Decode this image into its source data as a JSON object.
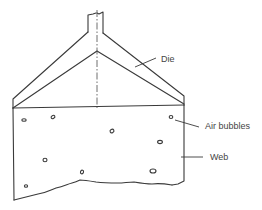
{
  "diagram": {
    "type": "technical-schematic",
    "labels": {
      "die": "Die",
      "air_bubbles": "Air bubbles",
      "web": "Web"
    },
    "colors": {
      "line": "#3a3a3a",
      "text": "#444444",
      "background": "#ffffff"
    },
    "bubbles": [
      {
        "cx": 24,
        "cy": 120,
        "rx": 2.2,
        "ry": 1.3
      },
      {
        "cx": 53,
        "cy": 117,
        "rx": 2.0,
        "ry": 1.6
      },
      {
        "cx": 171,
        "cy": 117,
        "rx": 1.8,
        "ry": 1.5
      },
      {
        "cx": 112,
        "cy": 131,
        "rx": 2.0,
        "ry": 1.8
      },
      {
        "cx": 160,
        "cy": 142,
        "rx": 2.3,
        "ry": 1.6
      },
      {
        "cx": 45,
        "cy": 160,
        "rx": 2.0,
        "ry": 1.8
      },
      {
        "cx": 82,
        "cy": 172,
        "rx": 1.6,
        "ry": 1.8
      },
      {
        "cx": 153,
        "cy": 171,
        "rx": 3.0,
        "ry": 2.0
      },
      {
        "cx": 26,
        "cy": 186,
        "rx": 1.6,
        "ry": 1.3
      }
    ]
  }
}
